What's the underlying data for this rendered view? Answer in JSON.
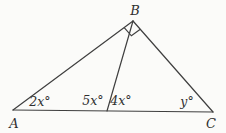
{
  "figure": {
    "type": "geometry-diagram",
    "background": "#fbfbf9",
    "stroke": "#3f3f3f",
    "stroke_width": 1.2,
    "text_color": "#2f2f2f",
    "points": {
      "A": [
        13,
        110
      ],
      "B": [
        133,
        21
      ],
      "C": [
        213,
        112
      ],
      "D": [
        107,
        111
      ]
    },
    "segments": [
      {
        "name": "side-AB",
        "from": "A",
        "to": "B"
      },
      {
        "name": "side-AC",
        "from": "A",
        "to": "C"
      },
      {
        "name": "side-BC",
        "from": "B",
        "to": "C"
      },
      {
        "name": "cevian-BD",
        "from": "B",
        "to": "D"
      }
    ],
    "right_angle_marker": {
      "vertex": "B",
      "toward1": "A",
      "toward2": "C",
      "size": 11
    },
    "vertex_labels": [
      {
        "name": "vertex-label-A",
        "text": "A",
        "x": 14,
        "y": 128
      },
      {
        "name": "vertex-label-B",
        "text": "B",
        "x": 135,
        "y": 15
      },
      {
        "name": "vertex-label-C",
        "text": "C",
        "x": 211,
        "y": 128
      }
    ],
    "angle_labels": [
      {
        "name": "angle-label-2x",
        "text": "2x°",
        "x": 40,
        "y": 106
      },
      {
        "name": "angle-label-5x",
        "text": "5x°",
        "x": 93,
        "y": 105
      },
      {
        "name": "angle-label-4x",
        "text": "4x°",
        "x": 121,
        "y": 105
      },
      {
        "name": "angle-label-y",
        "text": "y°",
        "x": 187,
        "y": 106
      }
    ]
  }
}
